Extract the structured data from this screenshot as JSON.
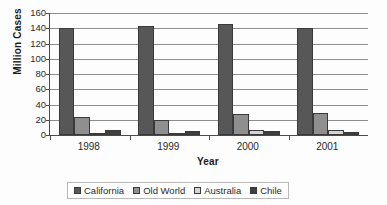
{
  "chart_data": {
    "type": "bar",
    "title": "",
    "xlabel": "Year",
    "ylabel": "Million Cases",
    "categories": [
      "1998",
      "1999",
      "2000",
      "2001"
    ],
    "ylim": [
      0,
      160
    ],
    "yticks": [
      0,
      20,
      40,
      60,
      80,
      100,
      120,
      140,
      160
    ],
    "grid": true,
    "legend_position": "bottom",
    "series": [
      {
        "name": "California",
        "color": "#575757",
        "values": [
          141,
          143,
          146,
          141
        ]
      },
      {
        "name": "Old World",
        "color": "#8f8f8f",
        "values": [
          23,
          20,
          28,
          29
        ]
      },
      {
        "name": "Australia",
        "color": "#d4d4d4",
        "values": [
          3,
          3,
          7,
          6
        ]
      },
      {
        "name": "Chile",
        "color": "#3f3f3f",
        "values": [
          6,
          5,
          5,
          4
        ]
      }
    ]
  }
}
